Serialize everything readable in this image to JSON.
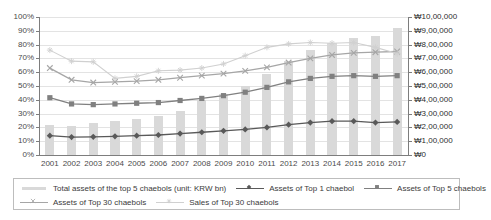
{
  "chart_data": {
    "type": "line",
    "title": "",
    "xlabel": "",
    "ylabel": "",
    "grid": true,
    "legend_position": "bottom",
    "categories": [
      "2001",
      "2002",
      "2003",
      "2004",
      "2005",
      "2006",
      "2007",
      "2008",
      "2009",
      "2010",
      "2011",
      "2012",
      "2013",
      "2014",
      "2015",
      "2016",
      "2017"
    ],
    "axes": {
      "left": {
        "label": "",
        "ylim": [
          0,
          100
        ],
        "unit": "%",
        "ticks": [
          "0%",
          "10%",
          "20%",
          "30%",
          "40%",
          "50%",
          "60%",
          "70%",
          "80%",
          "90%",
          "100%"
        ],
        "tick_values": [
          0,
          10,
          20,
          30,
          40,
          50,
          60,
          70,
          80,
          90,
          100
        ]
      },
      "right": {
        "label": "",
        "ylim": [
          0,
          1000000
        ],
        "unit": "KRW bn",
        "currency_symbol": "₩",
        "ticks": [
          "₩0",
          "₩1,00,000",
          "₩2,00,000",
          "₩3,00,000",
          "₩4,00,000",
          "₩5,00,000",
          "₩6,00,000",
          "₩7,00,000",
          "₩8,00,000",
          "₩9,00,000",
          "₩10,00,000"
        ],
        "tick_values": [
          0,
          100000,
          200000,
          300000,
          400000,
          500000,
          600000,
          700000,
          800000,
          900000,
          1000000
        ]
      }
    },
    "series": [
      {
        "name": "Total assets of the top 5 chaebols (unit: KRW bn)",
        "key": "total_assets_top5_bars",
        "type": "bar",
        "axis": "right",
        "color": "#d9d9d9",
        "marker": "bar",
        "values": [
          215000,
          210000,
          230000,
          245000,
          260000,
          280000,
          320000,
          400000,
          440000,
          500000,
          590000,
          680000,
          760000,
          810000,
          850000,
          860000,
          920000
        ]
      },
      {
        "name": "Assets of Top 1 chaebol",
        "key": "assets_top1",
        "type": "line",
        "axis": "left",
        "color": "#595959",
        "marker": "diamond",
        "values": [
          14.0,
          13.0,
          13.2,
          13.5,
          14.0,
          14.5,
          15.5,
          16.5,
          17.5,
          18.5,
          20.0,
          22.0,
          23.5,
          24.5,
          24.5,
          23.5,
          24.0
        ]
      },
      {
        "name": "Assets of Top 5 chaebols",
        "key": "assets_top5",
        "type": "line",
        "axis": "left",
        "color": "#808080",
        "marker": "square",
        "values": [
          41.5,
          37.0,
          36.5,
          37.0,
          37.5,
          38.0,
          39.5,
          41.0,
          43.0,
          45.5,
          49.0,
          53.0,
          55.5,
          57.0,
          57.5,
          57.0,
          57.5
        ]
      },
      {
        "name": "Assets of Top 30 chaebols",
        "key": "assets_top30",
        "type": "line",
        "axis": "left",
        "color": "#a6a6a6",
        "marker": "cross",
        "values": [
          63.0,
          54.5,
          52.5,
          53.0,
          53.5,
          54.5,
          56.0,
          57.5,
          59.0,
          61.0,
          63.5,
          67.0,
          70.0,
          72.5,
          74.0,
          74.5,
          75.0
        ]
      },
      {
        "name": "Sales of Top 30 chaebols",
        "key": "sales_top30",
        "type": "line",
        "axis": "left",
        "color": "#d0d0d0",
        "marker": "star",
        "values": [
          76.0,
          68.0,
          67.5,
          55.5,
          57.0,
          61.0,
          61.5,
          63.0,
          66.0,
          72.0,
          78.0,
          80.5,
          81.5,
          81.0,
          81.5,
          78.0,
          73.5
        ]
      }
    ]
  },
  "legend": {
    "rows": [
      [
        {
          "label": "Total assets of the top 5 chaebols (unit: KRW bn)",
          "marker": "bar",
          "color": "#d9d9d9"
        },
        {
          "label": "Assets of Top 1 chaebol",
          "marker": "diamond",
          "color": "#595959"
        },
        {
          "label": "Assets of Top 5 chaebols",
          "marker": "square",
          "color": "#808080"
        }
      ],
      [
        {
          "label": "Assets of Top 30 chaebols",
          "marker": "cross",
          "color": "#a6a6a6"
        },
        {
          "label": "Sales of Top 30 chaebols",
          "marker": "star",
          "color": "#d0d0d0"
        }
      ]
    ]
  }
}
